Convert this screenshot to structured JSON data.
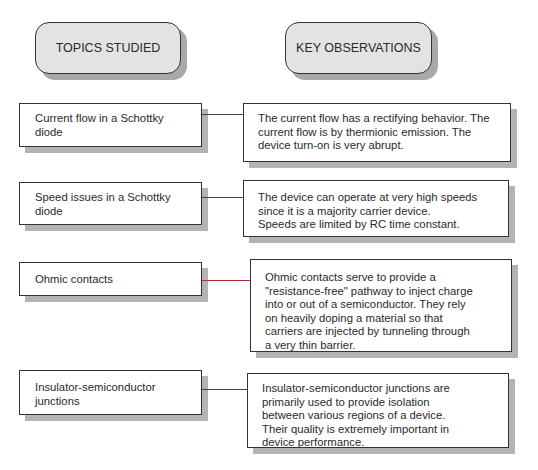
{
  "headers": {
    "topics": "TOPICS STUDIED",
    "observations": "KEY OBSERVATIONS"
  },
  "rows": [
    {
      "topic": "Current flow in a Schottky\ndiode",
      "observation": "The current flow has a rectifying behavior. The\ncurrent flow is by thermionic emission. The\ndevice turn-on is very abrupt.",
      "connector_color": "#444444"
    },
    {
      "topic": "Speed issues in a Schottky\ndiode",
      "observation": "The device can operate at very high speeds\nsince it is a majority carrier device.\nSpeeds are limited by RC time constant.",
      "connector_color": "#444444"
    },
    {
      "topic": "Ohmic contacts",
      "observation": "Ohmic contacts serve to provide a\n\"resistance-free\" pathway to inject charge\n into or out of a semiconductor. They rely\n on heavily doping a material so that\n carriers are injected by tunneling through\n a very thin barrier.",
      "connector_color": "#b22a36"
    },
    {
      "topic": "Insulator-semiconductor\njunctions",
      "observation": "Insulator-semiconductor junctions are\nprimarily used to provide isolation\nbetween various regions of a device.\nTheir quality is extremely important in\ndevice performance.",
      "connector_color": "#444444"
    }
  ]
}
